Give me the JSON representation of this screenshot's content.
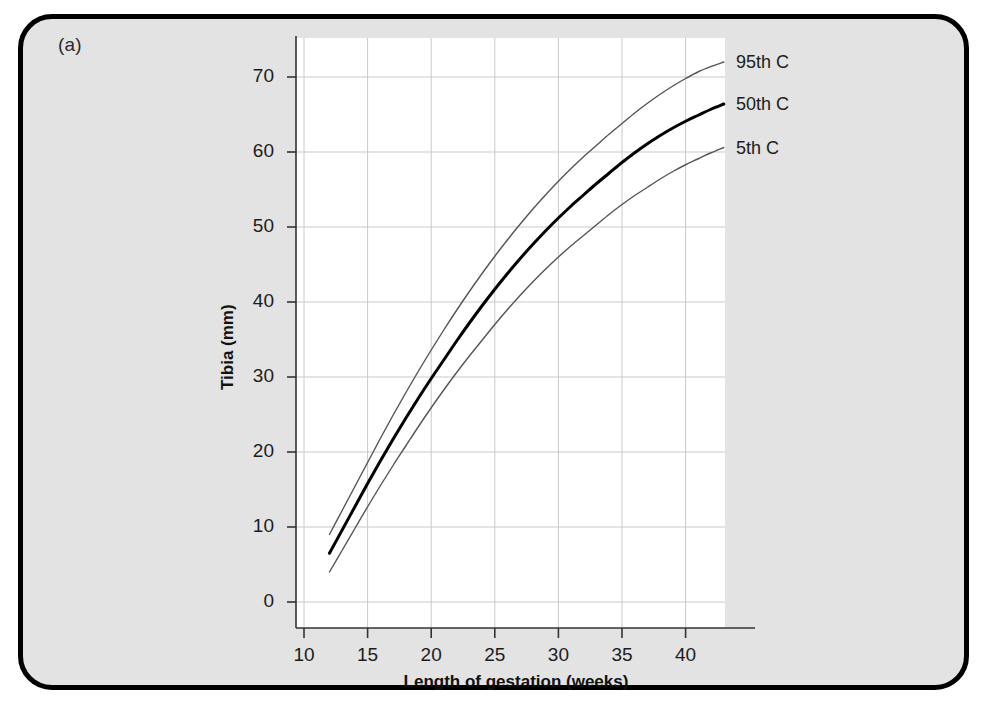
{
  "panel": {
    "label": "(a)",
    "background": "#e3e3e3",
    "border_color": "#000000"
  },
  "chart_data": {
    "type": "line",
    "title": "",
    "subtitle": "",
    "xlabel": "Length of gestation (weeks)",
    "ylabel": "Tibia (mm)",
    "xlim": [
      8.8,
      43.8
    ],
    "ylim": [
      -4,
      75
    ],
    "xticks": [
      10,
      15,
      20,
      25,
      30,
      35,
      40
    ],
    "yticks": [
      0,
      10,
      20,
      30,
      40,
      50,
      60,
      70
    ],
    "xticklabels": [
      "10",
      "15",
      "20",
      "25",
      "30",
      "35",
      "40"
    ],
    "yticklabels": [
      "0",
      "10",
      "20",
      "30",
      "40",
      "50",
      "60",
      "70"
    ],
    "grid": true,
    "grid_color": "#c9c9c9",
    "plot_background": "#ffffff",
    "legend_position": "right-inline",
    "x": [
      12,
      13,
      14,
      15,
      16,
      17,
      18,
      19,
      20,
      21,
      22,
      23,
      24,
      25,
      26,
      27,
      28,
      29,
      30,
      31,
      32,
      33,
      34,
      35,
      36,
      37,
      38,
      39,
      40,
      41,
      42,
      43
    ],
    "series": [
      {
        "name": "95th C",
        "label": "95th C",
        "color": "#555555",
        "linewidth": 1.4,
        "values": [
          9.0,
          12.2,
          15.4,
          18.6,
          21.8,
          24.9,
          27.9,
          30.8,
          33.6,
          36.3,
          38.9,
          41.4,
          43.8,
          46.1,
          48.3,
          50.4,
          52.4,
          54.3,
          56.1,
          57.8,
          59.4,
          60.9,
          62.4,
          63.8,
          65.2,
          66.5,
          67.7,
          68.8,
          69.8,
          70.7,
          71.4,
          72.0
        ]
      },
      {
        "name": "50th C",
        "label": "50th C",
        "color": "#000000",
        "linewidth": 3.0,
        "values": [
          6.5,
          9.6,
          12.7,
          15.8,
          18.8,
          21.7,
          24.5,
          27.2,
          29.8,
          32.3,
          34.8,
          37.2,
          39.5,
          41.7,
          43.8,
          45.8,
          47.7,
          49.5,
          51.2,
          52.8,
          54.3,
          55.8,
          57.2,
          58.6,
          59.9,
          61.1,
          62.2,
          63.2,
          64.1,
          64.9,
          65.7,
          66.4
        ]
      },
      {
        "name": "5th C",
        "label": "5th C",
        "color": "#555555",
        "linewidth": 1.4,
        "values": [
          4.0,
          6.9,
          9.8,
          12.7,
          15.5,
          18.2,
          20.8,
          23.4,
          25.9,
          28.3,
          30.6,
          32.8,
          34.9,
          37.0,
          39.0,
          40.9,
          42.7,
          44.4,
          46.0,
          47.5,
          48.9,
          50.3,
          51.7,
          53.0,
          54.2,
          55.3,
          56.4,
          57.4,
          58.3,
          59.1,
          59.9,
          60.6
        ]
      }
    ]
  },
  "legend": {
    "items": [
      {
        "label": "95th C"
      },
      {
        "label": "50th C"
      },
      {
        "label": "5th C"
      }
    ]
  },
  "geometry": {
    "plot_left": 296,
    "plot_right": 725,
    "plot_top": 38,
    "plot_bottom": 628,
    "x_at_week_10": 304,
    "px_per_week": 12.72,
    "y_at_zero": 602,
    "px_per_mm": 7.5
  }
}
